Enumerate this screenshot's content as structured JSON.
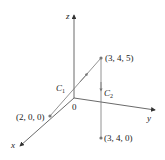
{
  "axes": {
    "x_label": "x",
    "y_label": "y",
    "z_label": "z",
    "origin_label": "0"
  },
  "points": [
    {
      "label": "(3, 4, 5)"
    },
    {
      "label": "(3, 4, 0)"
    },
    {
      "label": "(2, 0, 0)"
    }
  ],
  "curves": {
    "c1": {
      "label": "C",
      "sub": "1"
    },
    "c2": {
      "label": "C",
      "sub": "2"
    }
  },
  "colors": {
    "axis": "#444444",
    "curve": "#666666",
    "point": "#777777"
  }
}
